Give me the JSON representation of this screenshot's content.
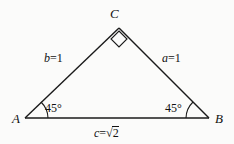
{
  "figure": {
    "type": "triangle-diagram",
    "stroke_color": "#1a1a1a",
    "background_color": "#fbfbfa",
    "text_color": "#111111",
    "vertices": [
      {
        "name": "C",
        "label": "C",
        "x": 119,
        "y": 28
      },
      {
        "name": "A",
        "label": "A",
        "x": 25,
        "y": 118
      },
      {
        "name": "B",
        "label": "B",
        "x": 209,
        "y": 118
      }
    ],
    "sides": [
      {
        "name": "b",
        "label_var": "b",
        "operator": "=",
        "value": "1",
        "full": "b = 1",
        "from": "A",
        "to": "C"
      },
      {
        "name": "a",
        "label_var": "a",
        "operator": "=",
        "value": "1",
        "full": "a = 1",
        "from": "C",
        "to": "B"
      },
      {
        "name": "c",
        "label_var": "c",
        "operator": "=",
        "value": "2",
        "radical": true,
        "full": "c = √2",
        "from": "A",
        "to": "B"
      }
    ],
    "angles": [
      {
        "at": "A",
        "label": "45°"
      },
      {
        "at": "B",
        "label": "45°"
      },
      {
        "at": "C",
        "label": "right-angle-marker",
        "marker": "square"
      }
    ]
  }
}
